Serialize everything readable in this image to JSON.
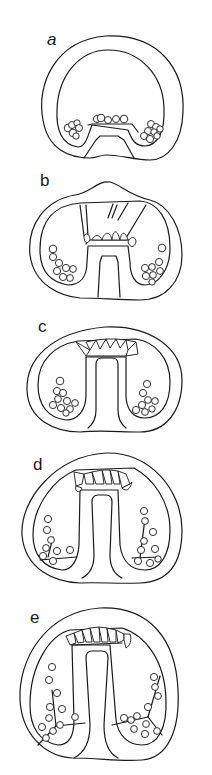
{
  "figure": {
    "type": "embryology-section-series",
    "stroke_color": "#1a1a1a",
    "background": "#ffffff",
    "panels": [
      {
        "label": "a"
      },
      {
        "label": "b"
      },
      {
        "label": "c"
      },
      {
        "label": "d"
      },
      {
        "label": "e"
      }
    ]
  }
}
